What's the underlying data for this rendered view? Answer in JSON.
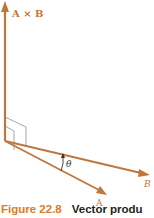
{
  "figure": {
    "labels": {
      "cross_product": "A × B",
      "vector_a": "A",
      "vector_b": "B",
      "angle": "θ"
    },
    "caption": {
      "number": "Figure 22.8",
      "title": "Vector produ"
    },
    "colors": {
      "vector": "#c0763a",
      "right_angle_marker": "#8a8f96",
      "caption_number": "#e07a22",
      "caption_title": "#231f20",
      "theta": "#333333"
    }
  }
}
